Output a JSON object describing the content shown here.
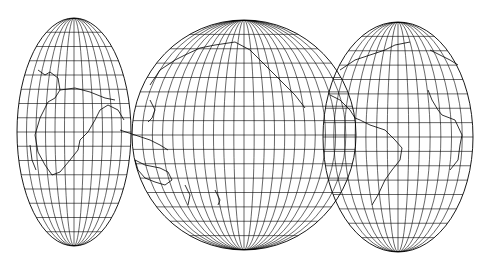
{
  "map": {
    "title": "",
    "projection": "interrupted elliptical world map (three lobes)",
    "line_color": "#000000",
    "background": "#ffffff",
    "lobes": [
      {
        "name": "africa-europe-indian-ocean",
        "cx": 74,
        "cy": 132,
        "rx": 57,
        "ry": 114,
        "meridians": 12,
        "parallels": 16
      },
      {
        "name": "pacific-asia-australia",
        "cx": 244,
        "cy": 135,
        "rx": 112,
        "ry": 115,
        "meridians": 22,
        "parallels": 16
      },
      {
        "name": "americas-atlantic",
        "cx": 398,
        "cy": 137,
        "rx": 75,
        "ry": 115,
        "meridians": 14,
        "parallels": 16
      }
    ]
  }
}
